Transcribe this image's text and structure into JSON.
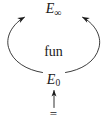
{
  "diagram": {
    "type": "commutative-diagram",
    "background_color": "#ffffff",
    "stroke_color": "#1a1a1a",
    "nodes": {
      "top": {
        "base": "E",
        "subscript": "∞",
        "full_text": "E∞",
        "name": "e-infinity"
      },
      "bottom": {
        "base": "E",
        "subscript": "0",
        "full_text": "E0",
        "name": "e-zero"
      },
      "center_label": {
        "text": "fun",
        "name": "fun"
      },
      "source_symbol": {
        "text": "=",
        "name": "equals"
      }
    },
    "edges": [
      {
        "name": "left-curved-arrow",
        "from": "E0",
        "to": "E∞",
        "style": "curved",
        "direction": "counterclockwise",
        "arrowhead": "at-target"
      },
      {
        "name": "right-curved-arrow",
        "from": "E0",
        "to": "E∞",
        "style": "curved",
        "direction": "clockwise",
        "arrowhead": "at-target"
      },
      {
        "name": "vertical-arrow",
        "from": "=",
        "to": "E0",
        "style": "straight",
        "direction": "upward",
        "arrowhead": "at-target"
      }
    ]
  }
}
